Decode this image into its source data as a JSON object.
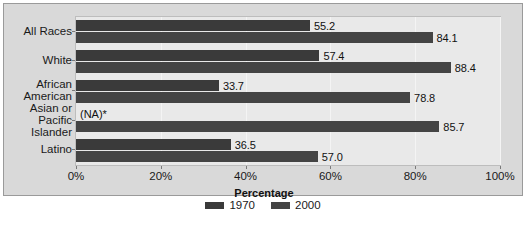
{
  "chart_data": {
    "type": "bar",
    "orientation": "horizontal",
    "title": "",
    "xlabel": "Percentage",
    "ylabel": "",
    "xlim": [
      0,
      100
    ],
    "xticks": [
      "0%",
      "20%",
      "40%",
      "60%",
      "80%",
      "100%"
    ],
    "xtick_values": [
      0,
      20,
      40,
      60,
      80,
      100
    ],
    "grid": true,
    "legend_position": "bottom",
    "categories": [
      "All Races",
      "White",
      "African American",
      "Asian or Pacific Islander",
      "Latino"
    ],
    "category_lines": [
      [
        "All Races"
      ],
      [
        "White"
      ],
      [
        "African",
        "American"
      ],
      [
        "Asian or",
        "Pacific",
        "Islander"
      ],
      [
        "Latino"
      ]
    ],
    "series": [
      {
        "name": "1970",
        "color": "#3a3a3a",
        "values": [
          55.2,
          57.4,
          33.7,
          null,
          36.5
        ],
        "labels": [
          "55.2",
          "57.4",
          "33.7",
          "(NA)*",
          "36.5"
        ]
      },
      {
        "name": "2000",
        "color": "#444444",
        "values": [
          84.1,
          88.4,
          78.8,
          85.7,
          57.0
        ],
        "labels": [
          "84.1",
          "88.4",
          "78.8",
          "85.7",
          "57.0"
        ]
      }
    ]
  },
  "legend": {
    "items": [
      {
        "label": "1970",
        "color": "#3a3a3a"
      },
      {
        "label": "2000",
        "color": "#444444"
      }
    ]
  },
  "axis": {
    "x_title": "Percentage"
  },
  "colors": {
    "frame_bg": "#d9d9d9",
    "plot_bg": "#e9e9e9",
    "gridline": "#f4f4f4",
    "series_1970": "#3a3a3a",
    "series_2000": "#444444",
    "text": "#1a1a1a"
  }
}
